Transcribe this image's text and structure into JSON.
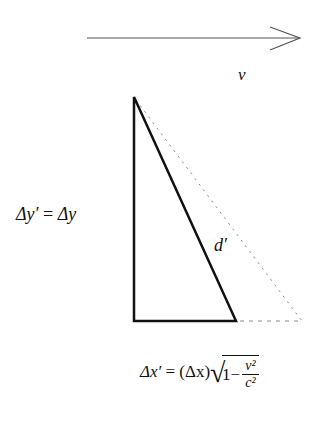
{
  "diagram": {
    "velocity_arrow": {
      "label": "v",
      "x1": 87,
      "y1": 38,
      "x2": 300,
      "y2": 38
    },
    "triangle": {
      "top": [
        134,
        97
      ],
      "bottom_left": [
        134,
        321
      ],
      "bottom_right": [
        236,
        321
      ],
      "hypotenuse_label": "d′"
    },
    "dotted_original": {
      "apex": [
        134,
        97
      ],
      "bottom_right": [
        302,
        321
      ]
    },
    "labels": {
      "vertical": "Δy′ = Δy",
      "vertical_lhs": "Δy′",
      "vertical_eq": " = ",
      "vertical_rhs": "Δy",
      "horizontal_lhs": "Δx′",
      "horizontal_eq": " = ",
      "horizontal_paren": "(Δx)",
      "horizontal_one": "1−",
      "horizontal_num": "v²",
      "horizontal_den": "c²"
    },
    "colors": {
      "line": "#111111",
      "dotted": "#888888",
      "arrow": "#555555"
    }
  }
}
